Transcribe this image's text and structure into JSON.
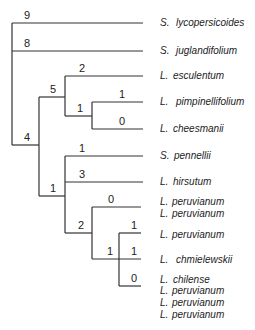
{
  "diagram": {
    "type": "phylogenetic-tree",
    "taxa": [
      {
        "genus": "S.",
        "species": "lycopersicoides",
        "y": 26
      },
      {
        "genus": "S.",
        "species": "juglandifolium",
        "y": 54
      },
      {
        "genus": "L.",
        "species": "esculentum",
        "y": 79
      },
      {
        "genus": "L.",
        "species": "pimpinellifolium",
        "y": 105
      },
      {
        "genus": "L.",
        "species": "cheesmanii",
        "y": 132
      },
      {
        "genus": "S.",
        "species": "pennellii",
        "y": 159
      },
      {
        "genus": "L.",
        "species": "hirsutum",
        "y": 185
      },
      {
        "genus": "L.",
        "species": "peruvianum",
        "y": 205
      },
      {
        "genus": "L.",
        "species": "peruvianum",
        "y": 217
      },
      {
        "genus": "L.",
        "species": "peruvianum",
        "y": 238
      },
      {
        "genus": "L.",
        "species": "chmielewskii",
        "y": 263
      },
      {
        "genus": "L.",
        "species": "chilense",
        "y": 283
      },
      {
        "genus": "L.",
        "species": "peruvianum",
        "y": 294
      },
      {
        "genus": "L.",
        "species": "peruvianum",
        "y": 306
      },
      {
        "genus": "L.",
        "species": "peruvianum",
        "y": 318
      }
    ],
    "branch_lengths": [
      {
        "value": "9",
        "x": 24,
        "y": 19,
        "label": "S. lycopersicoides"
      },
      {
        "value": "8",
        "x": 24,
        "y": 47,
        "label": "S. juglandifolium"
      },
      {
        "value": "2",
        "x": 79,
        "y": 72,
        "label": "L. esculentum"
      },
      {
        "value": "5",
        "x": 50,
        "y": 93,
        "label": "esculentum/pimpinellifolium/cheesmanii clade"
      },
      {
        "value": "1",
        "x": 119,
        "y": 98,
        "label": "L. pimpinellifolium"
      },
      {
        "value": "1",
        "x": 77,
        "y": 112,
        "label": "pimpinellifolium/cheesmanii clade"
      },
      {
        "value": "0",
        "x": 119,
        "y": 125,
        "label": "L. cheesmanii"
      },
      {
        "value": "4",
        "x": 24,
        "y": 141,
        "label": "Lycopersicon + S. pennellii clade"
      },
      {
        "value": "1",
        "x": 79,
        "y": 152,
        "label": "S. pennellii"
      },
      {
        "value": "3",
        "x": 79,
        "y": 178,
        "label": "L. hirsutum"
      },
      {
        "value": "1",
        "x": 50,
        "y": 192,
        "label": "pennellii/hirsutum/peruvianum clade"
      },
      {
        "value": "0",
        "x": 108,
        "y": 203,
        "label": "L. peruvianum (2)"
      },
      {
        "value": "2",
        "x": 78,
        "y": 229,
        "label": "peruvianum complex"
      },
      {
        "value": "1",
        "x": 131,
        "y": 229,
        "label": "L. peruvianum"
      },
      {
        "value": "1",
        "x": 107,
        "y": 255,
        "label": "chmielewskii/chilense clade"
      },
      {
        "value": "1",
        "x": 131,
        "y": 255,
        "label": "L. chmielewskii"
      },
      {
        "value": "0",
        "x": 131,
        "y": 282,
        "label": "L. chilense + L. peruvianum (3)"
      }
    ]
  }
}
